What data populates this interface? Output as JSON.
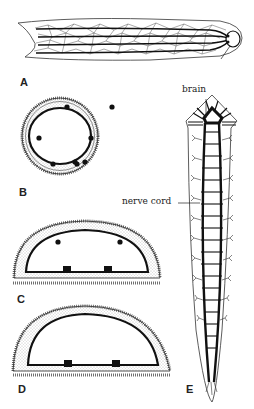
{
  "figure": {
    "panels": [
      {
        "id": "A",
        "label": "A",
        "description": "Flattened worm body with longitudinal nerve cords and net-like nerve plexus"
      },
      {
        "id": "B",
        "label": "B",
        "description": "Oval cross-section with peripheral nerve net and cords"
      },
      {
        "id": "C",
        "label": "C",
        "description": "Semi-elliptical cross-section with two ventral cords"
      },
      {
        "id": "D",
        "label": "D",
        "description": "Semi-elliptical cross-section with two ventral cords"
      },
      {
        "id": "E",
        "label": "E",
        "description": "Ladder-like nervous system with brain and paired nerve cords"
      }
    ],
    "annotations": {
      "brain": "brain",
      "nerve_cord": "nerve cord"
    },
    "colors": {
      "ink": "#1a1a1a",
      "background": "#ffffff",
      "stipple": "#9a9a9a"
    }
  }
}
